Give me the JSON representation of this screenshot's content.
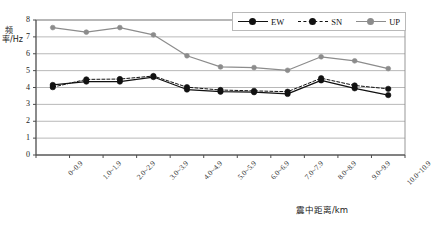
{
  "chart_data": {
    "type": "line",
    "title": "",
    "xlabel": "震中距离/km",
    "ylabel": "频率/Hz",
    "ylim": [
      0,
      8
    ],
    "yticks": [
      0,
      1,
      2,
      3,
      4,
      5,
      6,
      7,
      8
    ],
    "grid": "horizontal",
    "legend_position": "top-right",
    "categories": [
      "0~0.9",
      "1.0~1.9",
      "2.0~2.9",
      "3.0~3.9",
      "4.0~4.9",
      "5.0~5.9",
      "6.0~6.9",
      "7.0~7.9",
      "8.0~8.9",
      "9.0~9.9",
      "10.0~10.9"
    ],
    "series": [
      {
        "name": "EW",
        "color": "#111111",
        "linestyle": "solid",
        "marker": "filled-circle",
        "values": [
          4.15,
          4.35,
          4.35,
          4.62,
          3.88,
          3.75,
          3.72,
          3.62,
          4.42,
          3.95,
          3.55
        ]
      },
      {
        "name": "SN",
        "color": "#111111",
        "linestyle": "dashed",
        "marker": "filled-circle",
        "values": [
          4.02,
          4.48,
          4.5,
          4.68,
          4.02,
          3.85,
          3.8,
          3.75,
          4.55,
          4.12,
          3.92
        ]
      },
      {
        "name": "UP",
        "color": "#8c8c8c",
        "linestyle": "solid",
        "marker": "filled-circle-gray",
        "values": [
          7.55,
          7.28,
          7.55,
          7.12,
          5.88,
          5.22,
          5.18,
          5.02,
          5.82,
          5.58,
          5.12
        ]
      }
    ]
  },
  "legend": {
    "items": [
      {
        "label": "EW"
      },
      {
        "label": "SN"
      },
      {
        "label": "UP"
      }
    ]
  },
  "axes": {
    "y_axis_title": "频率/Hz",
    "x_axis_title": "震中距离/km"
  }
}
